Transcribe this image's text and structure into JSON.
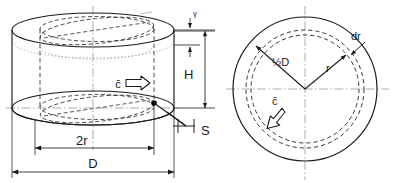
{
  "figure": {
    "views": [
      {
        "id": "elevation",
        "name": "3D cylinder elevation view"
      },
      {
        "id": "plan",
        "name": "Circular plan view"
      }
    ]
  },
  "colors": {
    "line": "#1a1a1a",
    "hidden": "#2b2b2b",
    "centerline": "#8a8a8a",
    "dimension": "#2b2b2b",
    "background": "#ffffff",
    "marker": "#000000"
  },
  "elevation": {
    "labels": {
      "gamma": "γ",
      "height": "H",
      "gap": "S",
      "two_r": "2r",
      "diameter": "D",
      "velocity": "c̄"
    },
    "names": {
      "gamma": "Gap at top of vessel",
      "height": "Fluid height H",
      "gap": "Clearance S",
      "two_r": "Inner diameter 2r",
      "diameter": "Vessel diameter D",
      "velocity": "Mean velocity c-bar"
    }
  },
  "plan": {
    "labels": {
      "half_diameter": "½D",
      "radius": "r",
      "dr": "dr",
      "velocity": "c̄"
    },
    "names": {
      "half_diameter": "Half diameter radius line",
      "radius": "Radius r to annular element",
      "dr": "Differential radial thickness dr",
      "velocity": "Tangential mean velocity c-bar"
    }
  }
}
